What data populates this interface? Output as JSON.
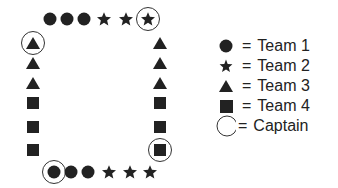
{
  "diagram": {
    "title": "",
    "formation": {
      "top_row": [
        "circle",
        "circle",
        "circle",
        "star",
        "star",
        "star-captain"
      ],
      "left_column": [
        "triangle-captain",
        "triangle",
        "triangle",
        "square",
        "square",
        "square"
      ],
      "right_column": [
        "triangle",
        "triangle",
        "triangle",
        "square",
        "square",
        "square-captain"
      ],
      "bottom_row": [
        "circle-captain",
        "circle",
        "circle",
        "star",
        "star",
        "star"
      ]
    }
  },
  "legend": {
    "items": [
      {
        "symbol": "circle",
        "eq": "=",
        "label": "Team 1"
      },
      {
        "symbol": "star",
        "eq": "=",
        "label": "Team 2"
      },
      {
        "symbol": "triangle",
        "eq": "=",
        "label": "Team 3"
      },
      {
        "symbol": "square",
        "eq": "=",
        "label": "Team 4"
      },
      {
        "symbol": "ring",
        "eq": "=",
        "label": "Captain"
      }
    ]
  }
}
